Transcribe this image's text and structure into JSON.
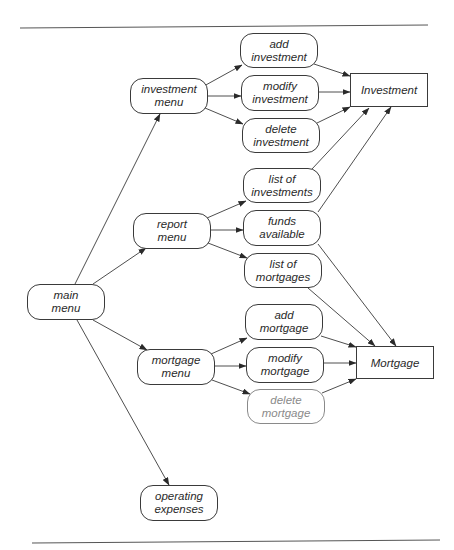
{
  "diagram": {
    "type": "structure-chart",
    "nodes": {
      "main_menu": {
        "line1": "main",
        "line2": "menu"
      },
      "investment_menu": {
        "line1": "investment",
        "line2": "menu"
      },
      "report_menu": {
        "line1": "report",
        "line2": "menu"
      },
      "mortgage_menu": {
        "line1": "mortgage",
        "line2": "menu"
      },
      "operating_expenses": {
        "line1": "operating",
        "line2": "expenses"
      },
      "add_investment": {
        "line1": "add",
        "line2": "investment"
      },
      "modify_investment": {
        "line1": "modify",
        "line2": "investment"
      },
      "delete_investment": {
        "line1": "delete",
        "line2": "investment"
      },
      "list_of_investments": {
        "line1": "list of",
        "line2": "investments"
      },
      "funds_available": {
        "line1": "funds",
        "line2": "available"
      },
      "list_of_mortgages": {
        "line1": "list of",
        "line2": "mortgages"
      },
      "add_mortgage": {
        "line1": "add",
        "line2": "mortgage"
      },
      "modify_mortgage": {
        "line1": "modify",
        "line2": "mortgage"
      },
      "delete_mortgage": {
        "line1": "delete",
        "line2": "mortgage"
      }
    },
    "entities": {
      "investment": "Investment",
      "mortgage": "Mortgage"
    },
    "edges": [
      [
        "main menu",
        "investment menu"
      ],
      [
        "main menu",
        "report menu"
      ],
      [
        "main menu",
        "mortgage menu"
      ],
      [
        "main menu",
        "operating expenses"
      ],
      [
        "investment menu",
        "add investment"
      ],
      [
        "investment menu",
        "modify investment"
      ],
      [
        "investment menu",
        "delete investment"
      ],
      [
        "report menu",
        "list of investments"
      ],
      [
        "report menu",
        "funds available"
      ],
      [
        "report menu",
        "list of mortgages"
      ],
      [
        "mortgage menu",
        "add mortgage"
      ],
      [
        "mortgage menu",
        "modify mortgage"
      ],
      [
        "mortgage menu",
        "delete mortgage"
      ],
      [
        "add investment",
        "Investment"
      ],
      [
        "modify investment",
        "Investment"
      ],
      [
        "delete investment",
        "Investment"
      ],
      [
        "list of investments",
        "Investment"
      ],
      [
        "funds available",
        "Investment"
      ],
      [
        "funds available",
        "Mortgage"
      ],
      [
        "list of mortgages",
        "Mortgage"
      ],
      [
        "add mortgage",
        "Mortgage"
      ],
      [
        "modify mortgage",
        "Mortgage"
      ],
      [
        "delete mortgage",
        "Mortgage"
      ]
    ],
    "colors": {
      "stroke": "#3a3a3a",
      "text": "#2a2a2a",
      "faded": "#8a8a8a"
    }
  }
}
